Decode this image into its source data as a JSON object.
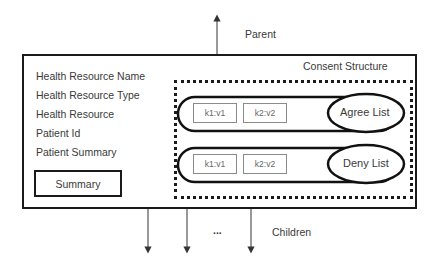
{
  "diagram": {
    "parent_label": "Parent",
    "children_label": "Children",
    "children_ellipsis": "...",
    "consent_structure_label": "Consent Structure",
    "fields": [
      {
        "label": "Health Resource Name"
      },
      {
        "label": "Health Resource Type"
      },
      {
        "label": "Health Resource"
      },
      {
        "label": "Patient Id"
      },
      {
        "label": "Patient Summary"
      }
    ],
    "summary_label": "Summary",
    "lists": [
      {
        "name": "Agree List",
        "pairs": [
          "k1:v1",
          "k2:v2"
        ]
      },
      {
        "name": "Deny List",
        "pairs": [
          "k1:v1",
          "k2:v2"
        ]
      }
    ]
  }
}
